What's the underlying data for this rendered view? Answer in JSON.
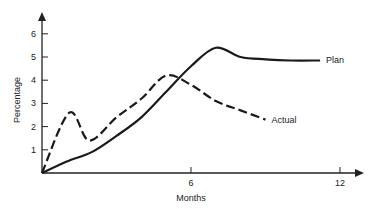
{
  "chart_data": {
    "type": "line",
    "title": "",
    "xlabel": "Months",
    "ylabel": "Percentage",
    "xlim": [
      0,
      13
    ],
    "ylim": [
      0,
      6.5
    ],
    "x_ticks": [
      6,
      12
    ],
    "y_ticks": [
      1,
      2,
      3,
      4,
      5,
      6
    ],
    "grid": false,
    "legend": "inline labels at line ends",
    "series": [
      {
        "name": "Plan",
        "style": "solid",
        "x": [
          0,
          1,
          2,
          3,
          4,
          5,
          6,
          7,
          8,
          9,
          10,
          11.2
        ],
        "values": [
          0,
          0.5,
          0.9,
          1.6,
          2.4,
          3.5,
          4.6,
          5.4,
          5.0,
          4.9,
          4.85,
          4.85
        ]
      },
      {
        "name": "Actual",
        "style": "dashed",
        "x": [
          0,
          1.1,
          1.9,
          3,
          4,
          5,
          6,
          7,
          8,
          9
        ],
        "values": [
          0,
          2.6,
          1.4,
          2.4,
          3.2,
          4.2,
          3.8,
          3.1,
          2.7,
          2.3
        ]
      }
    ]
  }
}
